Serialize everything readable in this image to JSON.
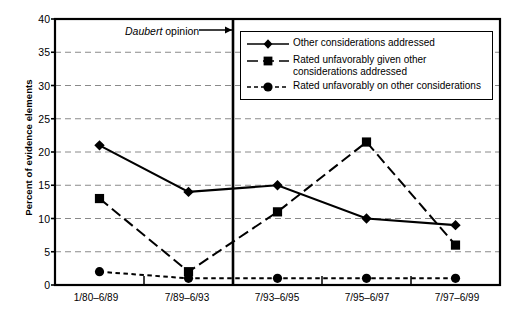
{
  "chart_data": {
    "type": "line",
    "title": "",
    "xlabel": "",
    "ylabel": "Percent of evidence elements",
    "ylim": [
      0,
      40
    ],
    "ytick_step": 5,
    "yticks": [
      "0",
      "5",
      "10",
      "15",
      "20",
      "25",
      "30",
      "35",
      "40"
    ],
    "categories": [
      "1/80–6/89",
      "7/89–6/93",
      "7/93–6/95",
      "7/95–6/97",
      "7/97–6/99"
    ],
    "grid": "horizontal-dashed",
    "legend_position": "top-right-inside",
    "series": [
      {
        "name": "Other considerations addressed",
        "marker": "diamond",
        "line": "solid",
        "values": [
          21,
          14,
          15,
          10,
          9
        ]
      },
      {
        "name": "Rated unfavorably given other considerations addressed",
        "marker": "square",
        "line": "long-dash",
        "values": [
          13,
          2,
          11,
          21.5,
          6
        ]
      },
      {
        "name": "Rated unfavorably on other considerations",
        "marker": "circle",
        "line": "short-dash",
        "values": [
          2,
          1,
          1,
          1,
          1
        ]
      }
    ],
    "annotations": [
      {
        "name": "daubert-opinion",
        "text_italic": "Daubert",
        "text_rest": " opinion",
        "arrow": "right",
        "points_to": "vertical-divider-between-7/89-6/93-and-7/93-6/95"
      }
    ],
    "divider": {
      "name": "daubert-line",
      "after_category": "7/89–6/93"
    }
  },
  "legend": {
    "items": [
      {
        "label": "Other considerations addressed"
      },
      {
        "label_line1": "Rated unfavorably given other",
        "label_line2": "considerations addressed"
      },
      {
        "label": "Rated unfavorably on other considerations"
      }
    ]
  }
}
